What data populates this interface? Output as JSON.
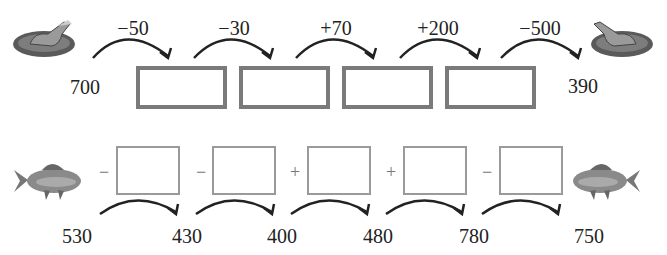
{
  "top_row": {
    "start_value": "700",
    "end_value": "390",
    "start_icon": "frog-on-lily-pad",
    "end_icon": "frog-on-lily-pad",
    "operations": [
      "−50",
      "−30",
      "+70",
      "+200",
      "−500"
    ],
    "answer_boxes": [
      "",
      "",
      "",
      ""
    ]
  },
  "bottom_row": {
    "start_icon": "fish",
    "end_icon": "fish",
    "operators": [
      "−",
      "−",
      "+",
      "+",
      "−"
    ],
    "answer_boxes": [
      "",
      "",
      "",
      "",
      ""
    ],
    "values": [
      "530",
      "430",
      "400",
      "480",
      "780",
      "750"
    ]
  }
}
